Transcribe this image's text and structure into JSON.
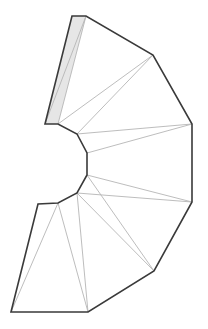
{
  "diagram": {
    "type": "triangulated-polygon",
    "colors": {
      "outline": "#3a3a3a",
      "inner_line": "#b5b5b5",
      "strip_fill": "#e6e6e6",
      "background": "#ffffff"
    },
    "outline_points": "72,16 86,16 153,55 192,124 192,202 154,271 88,312 11,312 38,204 58,203 77,193 87,175 87,153 77,134 58,124 45,124",
    "strip_points": "72,16 86,16 58,124 45,124",
    "inner_lines": [
      [
        86,
        16,
        58,
        124
      ],
      [
        86,
        16,
        45,
        124
      ],
      [
        153,
        55,
        58,
        124
      ],
      [
        153,
        55,
        77,
        134
      ],
      [
        192,
        124,
        77,
        134
      ],
      [
        192,
        124,
        87,
        153
      ],
      [
        192,
        202,
        87,
        175
      ],
      [
        192,
        202,
        77,
        193
      ],
      [
        154,
        271,
        87,
        175
      ],
      [
        154,
        271,
        77,
        193
      ],
      [
        88,
        312,
        77,
        193
      ],
      [
        88,
        312,
        58,
        203
      ],
      [
        11,
        312,
        58,
        203
      ]
    ]
  }
}
